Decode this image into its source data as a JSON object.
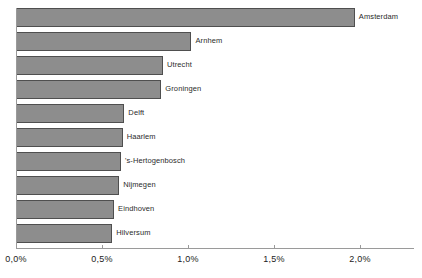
{
  "chart_data": {
    "type": "bar",
    "orientation": "horizontal",
    "title": "",
    "subtitle": "",
    "xlabel": "",
    "ylabel": "",
    "categories": [
      "Amsterdam",
      "Arnhem",
      "Utrecht",
      "Groningen",
      "Delft",
      "Haarlem",
      "'s-Hertogenbosch",
      "Nijmegen",
      "Eindhoven",
      "Hilversum"
    ],
    "values": [
      1.97,
      1.02,
      0.855,
      0.845,
      0.63,
      0.62,
      0.61,
      0.6,
      0.57,
      0.56
    ],
    "value_unit": "%",
    "xlim": [
      0,
      2.31
    ],
    "xticks": [
      0,
      0.5,
      1.0,
      1.5,
      2.0
    ],
    "xtick_labels": [
      "0,0%",
      "0,5%",
      "1,0%",
      "1,5%",
      "2,0%"
    ],
    "grid": false,
    "legend": null,
    "bar_color": "#8d8d8d",
    "bar_border_color": "#4f4f4f",
    "axis_color": "#9a9a9a",
    "label_color": "#2b2b2b"
  }
}
